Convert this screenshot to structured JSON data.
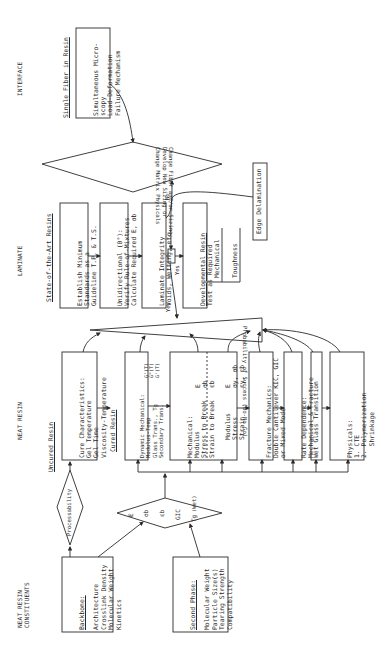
{
  "orientation": "rotated 90deg counter-clockwise (text reads bottom-to-top)",
  "columns": {
    "neat_resin_constituents": "NEAT RESIN\nCONSTITUENTS",
    "neat_resin": "NEAT RESIN",
    "laminate": "LAMINATE",
    "interface": "INTERFACE"
  },
  "interface": {
    "title": "Single Fiber in Resin",
    "box_lines": [
      "Simultaneous Micro-",
      "scopy",
      "Load-Deformation",
      "Failure Mechanism"
    ]
  },
  "change_diamond": {
    "lines": [
      "Change Fiber and/or Sizing;",
      "Develop New Sizing or",
      "Change Matrix Physicals"
    ]
  },
  "laminate": {
    "title": "State-of-the-Art Resins",
    "establish_box": [
      "Establish Minimum",
      "Standards as a",
      "Guideline T.P. & T.S."
    ],
    "unidirectional_box": [
      "Unidirectional (0°):",
      "Verify Rule-of-Mixtures",
      "Calculate Required E, σb"
    ],
    "integrity_box": [
      "Laminate Integrity",
      "Voids, Wetting, etc."
    ],
    "developmental_box": {
      "title": "Developmental Resin",
      "line": "Test as Required"
    },
    "test_branches": [
      "Mechanical",
      "Toughness"
    ],
    "edge_delamination": "Edge Delamination",
    "labels": {
      "no": "No",
      "yes_1": "Yes",
      "yes_2": "Yes"
    }
  },
  "probability": {
    "text": "Probability of Success (Go-No Go)"
  },
  "neat_resin": {
    "uncured_title": "Uncured Resin",
    "cure_box": [
      "Cure Characteristics:",
      "Gel Temperature",
      "Gel Time",
      "Viscosity-Temperature"
    ],
    "cured_title": "Cured Resin",
    "dynamic_box": {
      "lines": [
        "Dynamic Mechanical:",
        "Modulus-Temp",
        "Glass Trans., Tg",
        "Secondary Trans."
      ],
      "right": [
        "G'(T)",
        "G\"(T)",
        "G'(T)"
      ]
    },
    "mechanical_box": {
      "title": "Mechanical:",
      "left_lines": [
        "Modulus",
        "Stress to Break",
        "Strain to Break"
      ],
      "left_syms": [
        "E",
        "σb",
        "εb"
      ],
      "right_lines": [
        "Modulus",
        "Stress",
        "Strain"
      ],
      "right_syms": [
        "E",
        "σy, σb",
        "εy, εb"
      ]
    },
    "fracture_box": [
      "Fracture Mechanics:",
      "Double Cantilever KIC, GIC",
      "or Mixed Mode"
    ],
    "rate_box": [
      "Rate Dependence:",
      "Mechanical & Fracture"
    ],
    "wet_box": [
      "Wet Glass Transition"
    ],
    "physicals_box": [
      "Physicals:",
      "1. CTE",
      "2. Polymerization",
      "   Shrinkage"
    ]
  },
  "processability": {
    "label": "Processability"
  },
  "property_diamond": {
    "symbols": [
      "E",
      "σb",
      "εb",
      "GIC",
      "Tg",
      "(Wet)"
    ]
  },
  "constituents": {
    "backbone": {
      "title": "Backbone:",
      "lines": [
        "Architecture",
        "Crosslink Density",
        "Molecular Weight",
        "Kinetics"
      ]
    },
    "second_phase": {
      "title": "Second Phase:",
      "lines": [
        "Molecular Weight",
        "Particle Size(s)",
        "Tearing Strength",
        "Compatibility"
      ]
    }
  },
  "colors": {
    "ink": "#2a2a2a",
    "paper": "#ffffff"
  }
}
